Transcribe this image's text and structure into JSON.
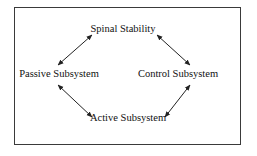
{
  "diagram": {
    "type": "cycle",
    "nodes": [
      {
        "id": "spinal",
        "label": "Spinal Stability",
        "x": 123,
        "y": 29
      },
      {
        "id": "passive",
        "label": "Passive Subsystem",
        "x": 59,
        "y": 74
      },
      {
        "id": "control",
        "label": "Control Subsystem",
        "x": 178,
        "y": 74
      },
      {
        "id": "active",
        "label": "Active Subsystem",
        "x": 128,
        "y": 118
      }
    ],
    "edges": [
      {
        "from": "passive",
        "to": "spinal",
        "bidirectional": true
      },
      {
        "from": "spinal",
        "to": "control",
        "bidirectional": true
      },
      {
        "from": "passive",
        "to": "active",
        "bidirectional": true
      },
      {
        "from": "active",
        "to": "control",
        "bidirectional": true
      }
    ],
    "colors": {
      "line": "#222222",
      "text": "#111111",
      "border": "#3a3a3a",
      "background": "#ffffff"
    }
  }
}
